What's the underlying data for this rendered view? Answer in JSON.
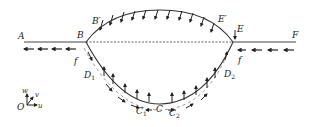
{
  "diagram": {
    "points": {
      "A": "A",
      "B": "B",
      "B_prime": "B′",
      "E": "E",
      "E_prime": "E′",
      "F": "F",
      "D1": "D",
      "D1_sub": "1",
      "D2": "D",
      "D2_sub": "2",
      "C": "C",
      "C1": "C",
      "C1_sub": "1",
      "C2": "C",
      "C2_sub": "2",
      "f_left": "f",
      "f_right": "f"
    },
    "axes": {
      "origin": "O",
      "u": "u",
      "v": "v",
      "w": "w"
    },
    "colors": {
      "line": "#333333",
      "dashed": "#555555"
    }
  }
}
